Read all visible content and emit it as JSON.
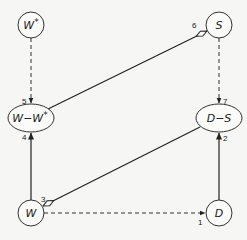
{
  "diagram": {
    "background": "#f6f6f4",
    "nodes": [
      {
        "id": "Wstar",
        "label": "W*",
        "shape": "circle",
        "cx": 31,
        "cy": 25,
        "r": 13
      },
      {
        "id": "S",
        "label": "S",
        "shape": "circle",
        "cx": 219,
        "cy": 25,
        "r": 13
      },
      {
        "id": "WminusWstar",
        "label": "W−W*",
        "shape": "ellipse",
        "cx": 31,
        "cy": 118,
        "rx": 23,
        "ry": 14
      },
      {
        "id": "DminusS",
        "label": "D−S",
        "shape": "ellipse",
        "cx": 219,
        "cy": 118,
        "rx": 23,
        "ry": 14
      },
      {
        "id": "W",
        "label": "W",
        "shape": "circle",
        "cx": 31,
        "cy": 213,
        "r": 13
      },
      {
        "id": "D",
        "label": "D",
        "shape": "circle",
        "cx": 219,
        "cy": 213,
        "r": 13
      }
    ],
    "edges": [
      {
        "num": "1",
        "from": "W",
        "to": "D",
        "style": "dashed",
        "arrow": "filled"
      },
      {
        "num": "2",
        "from": "D",
        "to": "D−S",
        "style": "solid",
        "arrow": "filled"
      },
      {
        "num": "3",
        "from": "D−S",
        "to": "W",
        "style": "solid",
        "arrow": "open-diamond"
      },
      {
        "num": "4",
        "from": "W",
        "to": "W−W*",
        "style": "solid",
        "arrow": "filled"
      },
      {
        "num": "5",
        "from": "W*",
        "to": "W−W*",
        "style": "dashed",
        "arrow": "filled"
      },
      {
        "num": "6",
        "from": "W−W*",
        "to": "S",
        "style": "solid",
        "arrow": "open-diamond"
      },
      {
        "num": "7",
        "from": "S",
        "to": "D−S",
        "style": "dashed",
        "arrow": "filled"
      }
    ]
  },
  "labels": {
    "wstar_base": "W",
    "wstar_sup": "*",
    "s": "S",
    "wmw_base": "W−W",
    "wmw_sup": "*",
    "dms": "D−S",
    "w": "W",
    "d": "D",
    "e1": "1",
    "e2": "2",
    "e3": "3",
    "e4": "4",
    "e5": "5",
    "e6": "6",
    "e7": "7"
  }
}
